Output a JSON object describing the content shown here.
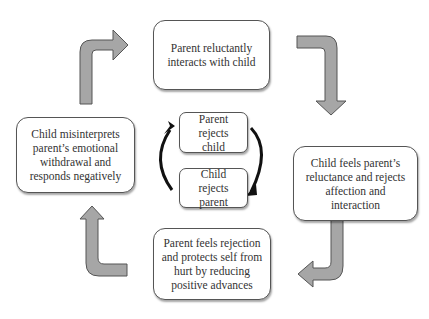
{
  "diagram": {
    "outer_cycle": [
      {
        "id": "top",
        "text": "Parent reluctantly interacts with child"
      },
      {
        "id": "right",
        "text": "Child feels parent’s reluctance and rejects affection and interaction"
      },
      {
        "id": "bottom",
        "text": "Parent feels rejection and protects self from hurt by reducing positive advances"
      },
      {
        "id": "left",
        "text": "Child misinterprets parent’s emotional withdrawal and responds negatively"
      }
    ],
    "inner_cycle": [
      {
        "id": "inner-top",
        "text": "Parent rejects child"
      },
      {
        "id": "inner-bottom",
        "text": "Child rejects parent"
      }
    ],
    "colors": {
      "outer_arrow_fill": "#a6a6a6",
      "outer_arrow_stroke": "#555555",
      "inner_arrow": "#111111",
      "box_border": "#555555"
    }
  }
}
